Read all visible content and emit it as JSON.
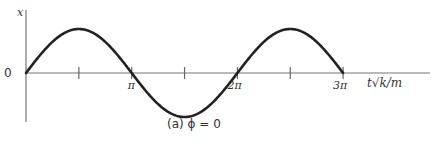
{
  "chart_data": {
    "type": "line",
    "title": "",
    "caption": "(a)   ϕ = 0",
    "xlabel": "t√k/m",
    "ylabel": "x",
    "origin_label": "0",
    "x_ticks": [
      {
        "value": 0,
        "label": ""
      },
      {
        "value": 1.5708,
        "label": ""
      },
      {
        "value": 3.1416,
        "label": "π"
      },
      {
        "value": 4.7124,
        "label": ""
      },
      {
        "value": 6.2832,
        "label": "2π"
      },
      {
        "value": 7.854,
        "label": ""
      },
      {
        "value": 9.4248,
        "label": "3π"
      }
    ],
    "xlim": [
      0,
      11.4
    ],
    "ylim": [
      -1.25,
      1.4
    ],
    "series": [
      {
        "name": "x(t) = A sin(t√k/m)",
        "function": "sin",
        "x_range": [
          0,
          9.4248
        ],
        "amplitude": 1
      }
    ],
    "grid": false,
    "legend": "none"
  }
}
